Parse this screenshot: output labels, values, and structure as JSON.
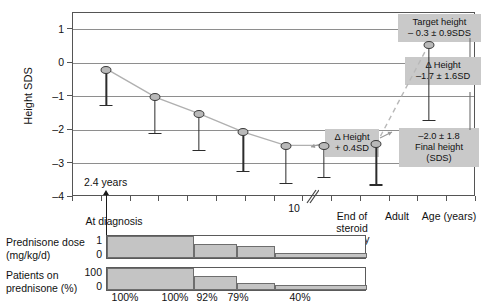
{
  "chart_data": {
    "type": "line",
    "title": "",
    "xlabel": "Age (years)",
    "ylabel": "Height SDS",
    "ylim": [
      -4,
      1.5
    ],
    "yticks": [
      1,
      0,
      -1,
      -2,
      -3,
      -4
    ],
    "ytick_labels": [
      "1",
      "0",
      "–1",
      "–2",
      "–3",
      "–4"
    ],
    "grid": true,
    "legend": "none",
    "xtick_labels": [
      "10"
    ],
    "x_categories": [
      "At diagnosis",
      "End of\nsteroid\ntherapy",
      "Adult",
      "Age (years)"
    ],
    "series": [
      {
        "name": "Height SDS during prednisone treatment",
        "points": [
          {
            "x_frac": 0.085,
            "y": -0.22,
            "err_low": -1.28
          },
          {
            "x_frac": 0.205,
            "y": -1.05,
            "err_low": -2.12
          },
          {
            "x_frac": 0.315,
            "y": -1.55,
            "err_low": -2.62
          },
          {
            "x_frac": 0.425,
            "y": -2.1,
            "err_low": -3.25
          },
          {
            "x_frac": 0.53,
            "y": -2.5,
            "err_low": -3.6
          },
          {
            "x_frac": 0.625,
            "y": -2.5,
            "err_low": -3.42
          },
          {
            "x_frac": 0.755,
            "y": -2.45,
            "err_low": -3.65
          }
        ]
      },
      {
        "name": "Adult final height",
        "points": [
          {
            "x_frac": 0.885,
            "y": 0.52,
            "err_low": -1.72
          }
        ]
      }
    ],
    "annotations": [
      {
        "name": "target-height",
        "text": "Target height\n– 0.3 ± 0.9SDS"
      },
      {
        "name": "delta-height-adult",
        "text": "Δ Height\n–1.7 ± 1.6SD"
      },
      {
        "name": "final-height",
        "text": "–2.0 ± 1.8\nFinal height\n(SDS)"
      },
      {
        "name": "delta-height-steroid",
        "text": "Δ Height\n+ 0.4SD"
      },
      {
        "name": "age-at-diagnosis",
        "text": "2.4 years"
      }
    ]
  },
  "axis": {
    "ylabel": "Height SDS",
    "yticks": [
      "1",
      "0",
      "–1",
      "–2",
      "–3",
      "–4"
    ],
    "xtick_10": "10",
    "cat_at_diagnosis": "At diagnosis",
    "cat_end_steroid": "End of\nsteroid\ntherapy",
    "cat_adult": "Adult",
    "cat_age_years": "Age (years)"
  },
  "callouts": {
    "target_height": "Target height\n– 0.3 ± 0.9SDS",
    "delta_height_adult": "Δ Height\n–1.7 ± 1.6SD",
    "final_height": "–2.0 ± 1.8\nFinal height\n(SDS)",
    "delta_height_steroid": "Δ Height\n+ 0.4SD"
  },
  "annotation": {
    "age_at_diagnosis": "2.4 years"
  },
  "panels": {
    "dose": {
      "title": "Prednisone dose\n(mg/kg/d)",
      "ytop": "1",
      "ybottom": "0",
      "values": [
        1.0,
        0.62,
        0.55,
        0.22,
        0.22
      ]
    },
    "patients": {
      "title": "Patients on\nprednisone (%)",
      "ytop": "100",
      "ybottom": "0",
      "values": [
        100,
        62,
        30,
        22,
        22
      ]
    },
    "percent_labels": [
      "100%",
      "100%",
      "92%",
      "79%",
      "40%"
    ]
  },
  "colors": {
    "marker_fill": "#b9b9b9",
    "marker_stroke": "#3a3a3a",
    "callout_bg": "#c9c9c9",
    "grid": "#8e8e8e",
    "bar_fill": "#c4c4c4",
    "axis": "#555555"
  }
}
